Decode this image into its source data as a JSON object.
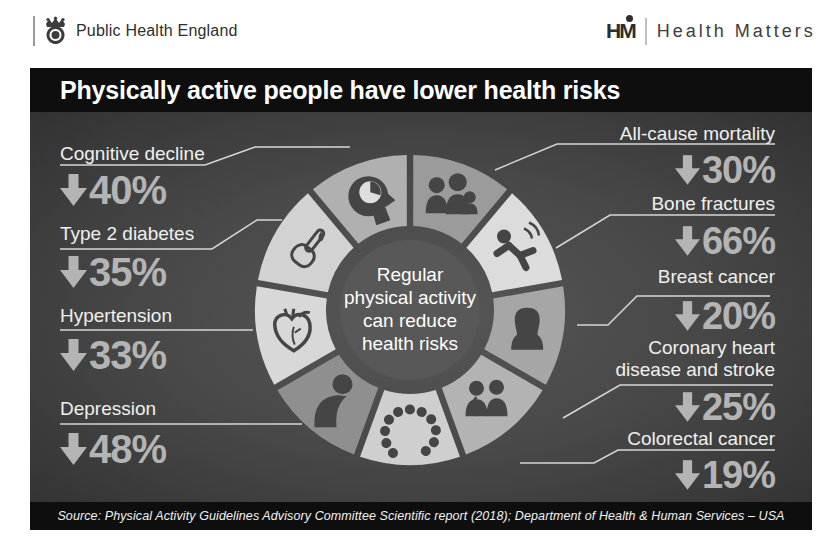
{
  "header": {
    "phe_logo_text": "Public Health England",
    "hm_monogram": "HM",
    "hm_logo_text": "Health Matters"
  },
  "infographic": {
    "title": "Physically active people have lower health risks",
    "center_lines": [
      "Regular",
      "physical activity",
      "can reduce",
      "health risks"
    ],
    "source": "Source: Physical Activity Guidelines Advisory Committee Scientific report (2018); Department of Health & Human Services – USA",
    "risks_left": [
      {
        "label": "Cognitive decline",
        "arrow": "down",
        "value": "40%"
      },
      {
        "label": "Type 2 diabetes",
        "arrow": "down",
        "value": "35%"
      },
      {
        "label": "Hypertension",
        "arrow": "down",
        "value": "33%"
      },
      {
        "label": "Depression",
        "arrow": "down",
        "value": "48%"
      }
    ],
    "risks_right": [
      {
        "label": "All-cause mortality",
        "arrow": "down",
        "value": "30%"
      },
      {
        "label": "Bone fractures",
        "arrow": "down",
        "value": "66%"
      },
      {
        "label": "Breast cancer",
        "arrow": "down",
        "value": "20%"
      },
      {
        "label": "Coronary heart disease and stroke",
        "arrow": "down",
        "value": "25%"
      },
      {
        "label": "Colorectal cancer",
        "arrow": "down",
        "value": "19%"
      }
    ]
  },
  "donut": {
    "segments": [
      {
        "name": "all-cause-mortality",
        "icon": "people-group-icon",
        "color": "#9b9b9b"
      },
      {
        "name": "bone-fractures",
        "icon": "falling-person-icon",
        "color": "#dcdcdc"
      },
      {
        "name": "breast-cancer",
        "icon": "woman-icon",
        "color": "#a6a6a6"
      },
      {
        "name": "coronary-heart-disease",
        "icon": "doctor-patient-icon",
        "color": "#b3b3b3"
      },
      {
        "name": "colorectal-cancer",
        "icon": "colon-icon",
        "color": "#cfcfcf"
      },
      {
        "name": "depression",
        "icon": "sitting-person-icon",
        "color": "#8f8f8f"
      },
      {
        "name": "hypertension",
        "icon": "heart-icon",
        "color": "#d8d8d8"
      },
      {
        "name": "type-2-diabetes",
        "icon": "finger-blood-drop-icon",
        "color": "#d2d2d2"
      },
      {
        "name": "cognitive-decline",
        "icon": "head-brain-icon",
        "color": "#b0b0b0"
      }
    ]
  },
  "colors": {
    "page_background": "#ffffff",
    "panel_bars": "#0e0e0e",
    "panel_background_mid": "#4f4f4f",
    "label_text": "#f0f0f0",
    "value_text": "#b4b4b4",
    "connector_line": "#d6d6d6",
    "center_circle": "#585858",
    "icon_dark": "#454545"
  },
  "chart_data": {
    "type": "pie",
    "subtype": "equal-segment donut infographic",
    "title": "Physically active people have lower health risks",
    "center_label": "Regular physical activity can reduce health risks",
    "categories": [
      "All-cause mortality",
      "Bone fractures",
      "Breast cancer",
      "Coronary heart disease and stroke",
      "Colorectal cancer",
      "Depression",
      "Hypertension",
      "Type 2 diabetes",
      "Cognitive decline"
    ],
    "values_percent_reduction": [
      30,
      66,
      20,
      25,
      19,
      48,
      33,
      35,
      40
    ],
    "direction": "decrease",
    "segment_angles_equal": true,
    "legend_position": "callout labels around donut",
    "source": "Physical Activity Guidelines Advisory Committee Scientific report (2018); Department of Health & Human Services – USA"
  }
}
